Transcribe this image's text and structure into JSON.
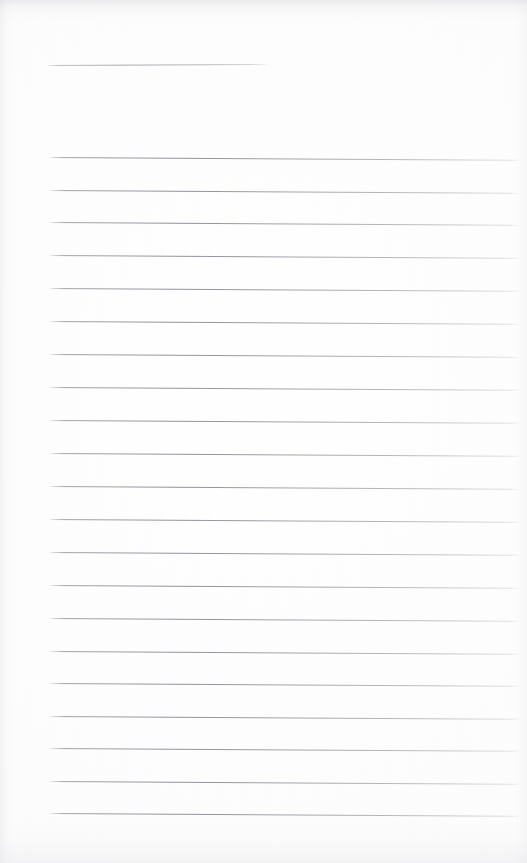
{
  "document": {
    "type": "scanned-lined-paper",
    "title": "",
    "body_text": "",
    "page_width": 527,
    "page_height": 863,
    "background_color": "#fdfdfd",
    "rule_color": "#80838b",
    "shadow_color": "#c4c6ca"
  },
  "header_rule": {
    "label": "title-rule",
    "x": 48,
    "y": 65,
    "width": 219,
    "slant_deg": -0.25
  },
  "ruled_lines": {
    "count": 21,
    "left_x": 50,
    "right_x": 519,
    "first_y": 157,
    "spacing": 32.8,
    "slant_deg": 0.35,
    "lines": [
      {
        "index": 1,
        "y": 157,
        "x": 50,
        "width": 469
      },
      {
        "index": 2,
        "y": 190,
        "x": 50,
        "width": 469
      },
      {
        "index": 3,
        "y": 222,
        "x": 50,
        "width": 469
      },
      {
        "index": 4,
        "y": 255,
        "x": 50,
        "width": 469
      },
      {
        "index": 5,
        "y": 288,
        "x": 50,
        "width": 469
      },
      {
        "index": 6,
        "y": 321,
        "x": 50,
        "width": 469
      },
      {
        "index": 7,
        "y": 354,
        "x": 50,
        "width": 469
      },
      {
        "index": 8,
        "y": 387,
        "x": 50,
        "width": 469
      },
      {
        "index": 9,
        "y": 420,
        "x": 50,
        "width": 469
      },
      {
        "index": 10,
        "y": 453,
        "x": 50,
        "width": 469
      },
      {
        "index": 11,
        "y": 486,
        "x": 50,
        "width": 469
      },
      {
        "index": 12,
        "y": 519,
        "x": 50,
        "width": 469
      },
      {
        "index": 13,
        "y": 552,
        "x": 50,
        "width": 469
      },
      {
        "index": 14,
        "y": 585,
        "x": 50,
        "width": 469
      },
      {
        "index": 15,
        "y": 618,
        "x": 50,
        "width": 469
      },
      {
        "index": 16,
        "y": 651,
        "x": 50,
        "width": 469
      },
      {
        "index": 17,
        "y": 683,
        "x": 50,
        "width": 469
      },
      {
        "index": 18,
        "y": 716,
        "x": 50,
        "width": 469
      },
      {
        "index": 19,
        "y": 748,
        "x": 50,
        "width": 469
      },
      {
        "index": 20,
        "y": 781,
        "x": 50,
        "width": 469
      },
      {
        "index": 21,
        "y": 813,
        "x": 50,
        "width": 469
      }
    ]
  }
}
